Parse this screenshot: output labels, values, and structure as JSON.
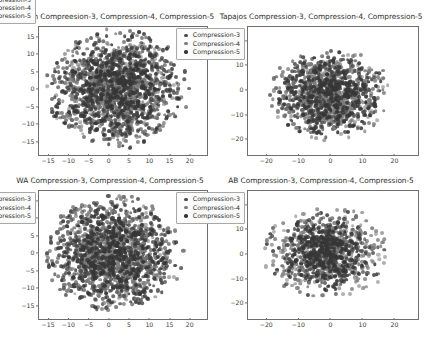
{
  "figure": {
    "width": 429,
    "height": 343,
    "background": "#ffffff",
    "layout": "2x2 grid of scatter panels"
  },
  "series_colors": {
    "Compression-3": "#4a4a4a",
    "Compression-4": "#7d7d7d",
    "Compression-5": "#363636"
  },
  "legend_labels": {
    "c3": "Compression-3",
    "c4": "Compression-4",
    "c5": "Compression-5"
  },
  "panels": {
    "maranon": {
      "title": "Maranon Compreesion-3, Compression-4, Compression-5",
      "legend_position": "lower right"
    },
    "tapajos": {
      "title": "Tapajos Compression-3, Compression-4, Compression-5",
      "legend_position": "upper right"
    },
    "wa": {
      "title": "WA Compression-3, Compression-4, Compression-5",
      "legend_position": "upper right"
    },
    "ab": {
      "title": "AB Compression-3, Compression-4, Compression-5",
      "legend_position": "upper right"
    }
  },
  "chart_data": [
    {
      "id": "maranon",
      "type": "scatter",
      "title": "Maranon Compreesion-3, Compression-4, Compression-5",
      "xlabel": "",
      "ylabel": "",
      "xlim": [
        -17.5,
        24.0
      ],
      "ylim": [
        -18.5,
        18.0
      ],
      "xticks": [
        -15,
        -10,
        -5,
        0,
        5,
        10,
        15,
        20
      ],
      "yticks": [
        -15,
        -10,
        -5,
        0,
        5,
        10,
        15
      ],
      "grid": false,
      "legend": [
        "Compression-3",
        "Compression-4",
        "Compression-5"
      ],
      "legend_position": "lower right",
      "series": [
        {
          "name": "Compression-3",
          "color": "#4a4a4a",
          "n_points": 620,
          "cluster": {
            "cx": 1.0,
            "cy": 0.5,
            "sx": 7.2,
            "sy": 7.4
          }
        },
        {
          "name": "Compression-4",
          "color": "#7d7d7d",
          "n_points": 520,
          "cluster": {
            "cx": 1.5,
            "cy": 0.0,
            "sx": 7.4,
            "sy": 7.2
          }
        },
        {
          "name": "Compression-5",
          "color": "#363636",
          "n_points": 700,
          "cluster": {
            "cx": 2.0,
            "cy": 0.5,
            "sx": 7.6,
            "sy": 7.4
          }
        }
      ]
    },
    {
      "id": "tapajos",
      "type": "scatter",
      "title": "Tapajos Compression-3, Compression-4, Compression-5",
      "xlabel": "",
      "ylabel": "",
      "xlim": [
        -26.0,
        27.0
      ],
      "ylim": [
        -26.0,
        26.0
      ],
      "xticks": [
        -20,
        -10,
        0,
        10,
        20
      ],
      "yticks": [
        -20,
        -10,
        0,
        10,
        20
      ],
      "grid": false,
      "legend": [
        "Compression-3",
        "Compression-4",
        "Compression-5"
      ],
      "legend_position": "upper right",
      "series": [
        {
          "name": "Compression-3",
          "color": "#4a4a4a",
          "n_points": 430,
          "cluster": {
            "cx": -1.0,
            "cy": -1.0,
            "sx": 7.8,
            "sy": 7.6
          }
        },
        {
          "name": "Compression-4",
          "color": "#7d7d7d",
          "n_points": 380,
          "cluster": {
            "cx": 0.0,
            "cy": -1.5,
            "sx": 8.4,
            "sy": 8.0
          }
        },
        {
          "name": "Compression-5",
          "color": "#363636",
          "n_points": 480,
          "cluster": {
            "cx": -0.5,
            "cy": -1.0,
            "sx": 8.0,
            "sy": 7.8
          }
        }
      ]
    },
    {
      "id": "wa",
      "type": "scatter",
      "title": "WA Compression-3, Compression-4, Compression-5",
      "xlabel": "",
      "ylabel": "",
      "xlim": [
        -17.5,
        24.0
      ],
      "ylim": [
        -18.5,
        18.0
      ],
      "xticks": [
        -15,
        -10,
        -5,
        0,
        5,
        10,
        15,
        20
      ],
      "yticks": [
        -15,
        -10,
        -5,
        0,
        5,
        10,
        15
      ],
      "grid": false,
      "legend": [
        "Compression-3",
        "Compression-4",
        "Compression-5"
      ],
      "legend_position": "upper right",
      "series": [
        {
          "name": "Compression-3",
          "color": "#4a4a4a",
          "n_points": 600,
          "cluster": {
            "cx": 0.5,
            "cy": 0.0,
            "sx": 7.0,
            "sy": 7.2
          }
        },
        {
          "name": "Compression-4",
          "color": "#7d7d7d",
          "n_points": 500,
          "cluster": {
            "cx": 1.0,
            "cy": 0.5,
            "sx": 7.2,
            "sy": 7.0
          }
        },
        {
          "name": "Compression-5",
          "color": "#363636",
          "n_points": 680,
          "cluster": {
            "cx": 1.0,
            "cy": 0.0,
            "sx": 7.4,
            "sy": 7.2
          }
        }
      ]
    },
    {
      "id": "ab",
      "type": "scatter",
      "title": "AB Compression-3, Compression-4, Compression-5",
      "xlabel": "",
      "ylabel": "",
      "xlim": [
        -26.0,
        27.0
      ],
      "ylim": [
        -26.0,
        26.0
      ],
      "xticks": [
        -20,
        -10,
        0,
        10,
        20
      ],
      "yticks": [
        -20,
        -10,
        0,
        10,
        20
      ],
      "grid": false,
      "legend": [
        "Compression-3",
        "Compression-4",
        "Compression-5"
      ],
      "legend_position": "upper right",
      "series": [
        {
          "name": "Compression-3",
          "color": "#4a4a4a",
          "n_points": 360,
          "cluster": {
            "cx": -1.5,
            "cy": 1.0,
            "sx": 8.6,
            "sy": 8.2
          }
        },
        {
          "name": "Compression-4",
          "color": "#7d7d7d",
          "n_points": 320,
          "cluster": {
            "cx": -1.0,
            "cy": 0.5,
            "sx": 9.0,
            "sy": 8.6
          }
        },
        {
          "name": "Compression-5",
          "color": "#363636",
          "n_points": 420,
          "cluster": {
            "cx": -2.0,
            "cy": 1.0,
            "sx": 6.2,
            "sy": 6.6
          }
        }
      ]
    }
  ]
}
